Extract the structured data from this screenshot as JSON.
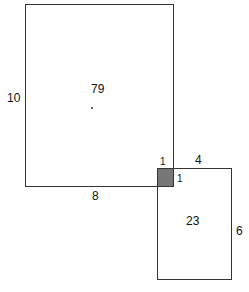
{
  "diagram": {
    "large_rect": {
      "area": "79",
      "height_label": "10",
      "width_label": "8"
    },
    "small_rect": {
      "area": "23",
      "height_label": "6",
      "width_label": "4"
    },
    "overlap": {
      "width_label": "1",
      "height_label": "1",
      "fill": "#777777"
    }
  }
}
